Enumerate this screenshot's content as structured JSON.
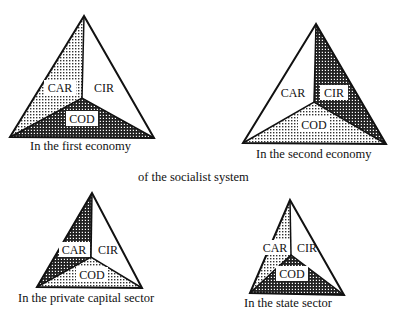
{
  "figure": {
    "center_caption": "of the socialist system",
    "segment_labels": [
      "CAR",
      "CIR",
      "COD"
    ],
    "patterns": {
      "light": "light dotted shading",
      "dark": "dark checkered shading",
      "blank": "white (no shading)"
    },
    "triangles": [
      {
        "id": "first-economy",
        "caption": "In the first economy",
        "labels": {
          "car": "CAR",
          "cir": "CIR",
          "cod": "COD"
        },
        "shading": {
          "car": "light",
          "cir": "blank",
          "cod": "dark"
        }
      },
      {
        "id": "second-economy",
        "caption": "In the second economy",
        "labels": {
          "car": "CAR",
          "cir": "CIR",
          "cod": "COD"
        },
        "shading": {
          "car": "blank",
          "cir": "dark",
          "cod": "light"
        }
      },
      {
        "id": "private-capital-sector",
        "caption": "In the private capital sector",
        "labels": {
          "car": "CAR",
          "cir": "CIR",
          "cod": "COD"
        },
        "shading": {
          "car": "dark",
          "cir": "blank",
          "cod": "light"
        }
      },
      {
        "id": "state-sector",
        "caption": "In the state sector",
        "labels": {
          "car": "CAR",
          "cir": "CIR",
          "cod": "COD"
        },
        "shading": {
          "car": "light",
          "cir": "blank",
          "cod": "dark"
        }
      }
    ]
  }
}
